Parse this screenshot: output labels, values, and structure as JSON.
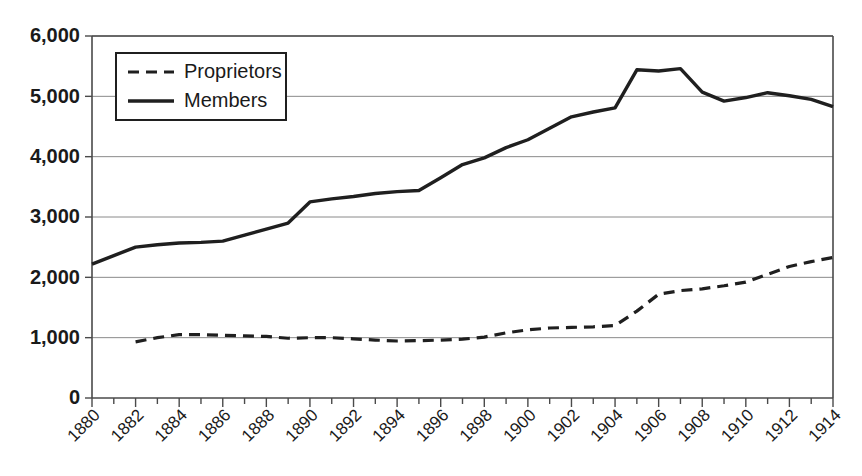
{
  "chart_data": {
    "type": "line",
    "title": "",
    "subtitle": "",
    "xlabel": "",
    "ylabel": "",
    "xlim": [
      1880,
      1914
    ],
    "ylim": [
      0,
      6000
    ],
    "grid": true,
    "legend_position": "upper-left",
    "y_ticks": [
      0,
      1000,
      2000,
      3000,
      4000,
      5000,
      6000
    ],
    "y_tick_labels": [
      "0",
      "1,000",
      "2,000",
      "3,000",
      "4,000",
      "5,000",
      "6,000"
    ],
    "x_ticks": [
      1880,
      1882,
      1884,
      1886,
      1888,
      1890,
      1892,
      1894,
      1896,
      1898,
      1900,
      1902,
      1904,
      1906,
      1908,
      1910,
      1912,
      1914
    ],
    "x_tick_labels": [
      "1880",
      "1882",
      "1884",
      "1886",
      "1888",
      "1890",
      "1892",
      "1894",
      "1896",
      "1898",
      "1900",
      "1902",
      "1904",
      "1906",
      "1908",
      "1910",
      "1912",
      "1914"
    ],
    "x_minor_ticks": [
      1881,
      1883,
      1885,
      1887,
      1889,
      1891,
      1893,
      1895,
      1897,
      1899,
      1901,
      1903,
      1905,
      1907,
      1909,
      1911,
      1913
    ],
    "x": [
      1880,
      1881,
      1882,
      1883,
      1884,
      1885,
      1886,
      1887,
      1888,
      1889,
      1890,
      1891,
      1892,
      1893,
      1894,
      1895,
      1896,
      1897,
      1898,
      1899,
      1900,
      1901,
      1902,
      1903,
      1904,
      1905,
      1906,
      1907,
      1908,
      1909,
      1910,
      1911,
      1912,
      1913,
      1914
    ],
    "series": [
      {
        "name": "Proprietors",
        "style": "dashed",
        "color": "#1f1f1f",
        "x": [
          1882,
          1883,
          1884,
          1885,
          1886,
          1887,
          1888,
          1889,
          1890,
          1891,
          1892,
          1893,
          1894,
          1895,
          1896,
          1897,
          1898,
          1899,
          1900,
          1901,
          1902,
          1903,
          1904,
          1905,
          1906,
          1907,
          1908,
          1909,
          1910,
          1911,
          1912,
          1913,
          1914
        ],
        "values": [
          930,
          1000,
          1050,
          1050,
          1040,
          1030,
          1020,
          990,
          1000,
          1000,
          980,
          960,
          945,
          950,
          960,
          975,
          1010,
          1080,
          1130,
          1160,
          1170,
          1180,
          1200,
          1440,
          1720,
          1780,
          1810,
          1860,
          1920,
          2050,
          2180,
          2260,
          2330
        ]
      },
      {
        "name": "Members",
        "style": "solid",
        "color": "#1f1f1f",
        "x": [
          1880,
          1881,
          1882,
          1883,
          1884,
          1885,
          1886,
          1887,
          1888,
          1889,
          1890,
          1891,
          1892,
          1893,
          1894,
          1895,
          1896,
          1897,
          1898,
          1899,
          1900,
          1901,
          1902,
          1903,
          1904,
          1905,
          1906,
          1907,
          1908,
          1909,
          1910,
          1911,
          1912,
          1913,
          1914
        ],
        "values": [
          2220,
          2360,
          2500,
          2540,
          2570,
          2580,
          2600,
          2700,
          2800,
          2900,
          3250,
          3300,
          3340,
          3390,
          3420,
          3440,
          3650,
          3870,
          3980,
          4150,
          4280,
          4470,
          4660,
          4740,
          4810,
          5440,
          5420,
          5460,
          5070,
          4920,
          4980,
          5060,
          5010,
          4950,
          4830
        ]
      }
    ]
  },
  "legend": {
    "entries": [
      {
        "label": "Proprietors",
        "style": "dashed"
      },
      {
        "label": "Members",
        "style": "solid"
      }
    ]
  }
}
